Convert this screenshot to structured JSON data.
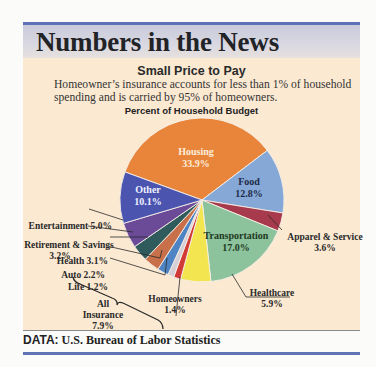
{
  "header": {
    "title": "Numbers in the News"
  },
  "subtitle": "Small Price to Pay",
  "description": "Homeowner’s insurance accounts for less than 1% of household spending and is carried by 95% of homeowners.",
  "footer": {
    "source_label": "DATA:",
    "source": "U.S. Bureau of Labor Statistics"
  },
  "chart_data": {
    "type": "pie",
    "title": "Percent of Household Budget",
    "categories": [
      "Housing",
      "Food",
      "Apparel & Service",
      "Transportation",
      "Healthcare",
      "Homeowners",
      "Life",
      "Auto",
      "Health",
      "Retirement & Savings",
      "Entertainment",
      "Other"
    ],
    "values": [
      33.9,
      12.8,
      3.6,
      17.0,
      5.9,
      1.4,
      1.2,
      2.2,
      3.1,
      3.2,
      5.0,
      10.1
    ],
    "colors": [
      "#e9853a",
      "#86a8d6",
      "#a83a4e",
      "#8cc29c",
      "#f3e550",
      "#d23a35",
      "#d6cfd6",
      "#4e84c4",
      "#c8704a",
      "#2f5b5c",
      "#6b4a97",
      "#4b55b0"
    ],
    "labels": [
      "Housing 33.9%",
      "Food 12.8%",
      "Apparel & Service 3.6%",
      "Transportation 17.0%",
      "Healthcare 5.9%",
      "Homeowners 1.4%",
      "Life 1.2%",
      "Auto 2.2%",
      "Health 3.1%",
      "Retirement & Savings 3.2%",
      "Entertainment 5.0%",
      "Other 10.1%"
    ],
    "annotations": [
      {
        "group": "All Insurance",
        "value": "7.9%",
        "members": [
          "Homeowners",
          "Life",
          "Auto",
          "Health"
        ]
      }
    ],
    "start_angle_deg_clockwise_from_top": -70,
    "legend": "none (labels on/next to slices)"
  },
  "labels": {
    "housing": {
      "name": "Housing",
      "pct": "33.9%"
    },
    "food": {
      "name": "Food",
      "pct": "12.8%"
    },
    "other": {
      "name": "Other",
      "pct": "10.1%"
    },
    "transportation": {
      "name": "Transportation",
      "pct": "17.0%"
    },
    "apparel": {
      "name": "Apparel & Service",
      "pct": "3.6%"
    },
    "healthcare": {
      "name": "Healthcare",
      "pct": "5.9%"
    },
    "homeowners": {
      "name": "Homeowners",
      "pct": "1.4%"
    },
    "life": "Life 1.2%",
    "auto": "Auto 2.2%",
    "health": "Health 3.1%",
    "retirement": {
      "name": "Retirement & Savings",
      "pct": "3.2%"
    },
    "entertainment": "Entertainment 5.0%",
    "all_insurance": {
      "line1": "All",
      "line2": "Insurance",
      "pct": "7.9%"
    }
  }
}
